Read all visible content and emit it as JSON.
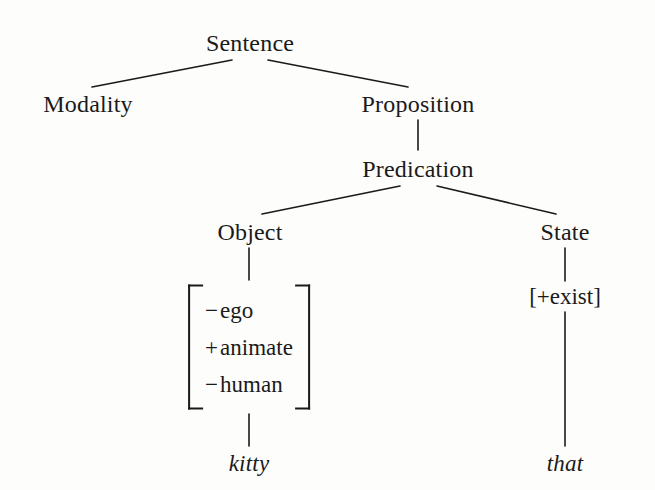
{
  "diagram": {
    "type": "linguistic-tree",
    "title": "",
    "background_color": "#fdfdfb",
    "line_color": "#1a1a1a",
    "nodes": {
      "sentence": "Sentence",
      "modality": "Modality",
      "proposition": "Proposition",
      "predication": "Predication",
      "object": "Object",
      "state": "State"
    },
    "feature_matrix": {
      "rows": [
        {
          "sign": "−",
          "feature": "ego"
        },
        {
          "sign": "+",
          "feature": "animate"
        },
        {
          "sign": "−",
          "feature": "human"
        }
      ]
    },
    "state_feature": "[+exist]",
    "terminals": {
      "object_word": "kitty",
      "state_word": "that"
    }
  }
}
